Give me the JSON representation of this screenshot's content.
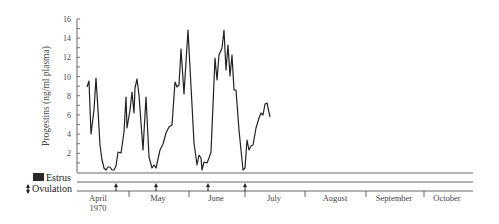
{
  "chart_data": {
    "type": "line",
    "title": "",
    "xlabel": "",
    "ylabel": "Progestins (ng/ml plasma)",
    "ylim": [
      0,
      16
    ],
    "yticks": [
      2,
      4,
      6,
      8,
      10,
      12,
      14,
      16
    ],
    "grid": false,
    "legend": [
      {
        "name": "Estrus",
        "symbol": "filled-rectangle"
      },
      {
        "name": "Ovulation",
        "symbol": "up-arrow"
      }
    ],
    "months": [
      {
        "label": "April",
        "sublabel": "1970"
      },
      {
        "label": "May",
        "sublabel": ""
      },
      {
        "label": "June",
        "sublabel": ""
      },
      {
        "label": "July",
        "sublabel": ""
      },
      {
        "label": "August",
        "sublabel": ""
      },
      {
        "label": "September",
        "sublabel": ""
      },
      {
        "label": "October",
        "sublabel": ""
      }
    ],
    "ovulation_markers_px": [
      116,
      156,
      208,
      245
    ],
    "series": [
      {
        "name": "Progestins",
        "points_px": [
          [
            87,
            87
          ],
          [
            89,
            81
          ],
          [
            91,
            134
          ],
          [
            94,
            110
          ],
          [
            96,
            78
          ],
          [
            98,
            110
          ],
          [
            100,
            145
          ],
          [
            102,
            160
          ],
          [
            104,
            168
          ],
          [
            106,
            170
          ],
          [
            108,
            167
          ],
          [
            110,
            167
          ],
          [
            112,
            170
          ],
          [
            114,
            170
          ],
          [
            116,
            166
          ],
          [
            118,
            152
          ],
          [
            121,
            153
          ],
          [
            124,
            132
          ],
          [
            126,
            97
          ],
          [
            127,
            128
          ],
          [
            130,
            110
          ],
          [
            132,
            92
          ],
          [
            134,
            113
          ],
          [
            135,
            88
          ],
          [
            137,
            79
          ],
          [
            139,
            95
          ],
          [
            143,
            150
          ],
          [
            146,
            97
          ],
          [
            149,
            157
          ],
          [
            152,
            168
          ],
          [
            154,
            165
          ],
          [
            156,
            168
          ],
          [
            160,
            150
          ],
          [
            163,
            144
          ],
          [
            166,
            133
          ],
          [
            169,
            127
          ],
          [
            172,
            125
          ],
          [
            175,
            82
          ],
          [
            177,
            87
          ],
          [
            179,
            85
          ],
          [
            181,
            49
          ],
          [
            184,
            94
          ],
          [
            188,
            30
          ],
          [
            192,
            105
          ],
          [
            194,
            143
          ],
          [
            197,
            165
          ],
          [
            199,
            155
          ],
          [
            201,
            158
          ],
          [
            202,
            170
          ],
          [
            204,
            162
          ],
          [
            207,
            163
          ],
          [
            209,
            158
          ],
          [
            211,
            152
          ],
          [
            215,
            58
          ],
          [
            217,
            80
          ],
          [
            219,
            55
          ],
          [
            222,
            48
          ],
          [
            224,
            30
          ],
          [
            226,
            70
          ],
          [
            228,
            45
          ],
          [
            230,
            76
          ],
          [
            232,
            55
          ],
          [
            234,
            90
          ],
          [
            236,
            90
          ],
          [
            239,
            130
          ],
          [
            243,
            170
          ],
          [
            245,
            168
          ],
          [
            247,
            140
          ],
          [
            249,
            150
          ],
          [
            251,
            146
          ],
          [
            253,
            145
          ],
          [
            256,
            128
          ],
          [
            259,
            118
          ],
          [
            261,
            113
          ],
          [
            263,
            115
          ],
          [
            265,
            104
          ],
          [
            267,
            103
          ],
          [
            270,
            117
          ]
        ],
        "approx_values_ng_ml": [
          8.8,
          9.5,
          4.0,
          6.5,
          10.0,
          6.5,
          2.8,
          1.2,
          0.4,
          0.2,
          0.5,
          0.5,
          0.2,
          0.2,
          0.6,
          2.1,
          2.0,
          4.2,
          7.8,
          4.6,
          6.5,
          8.3,
          6.1,
          8.7,
          9.7,
          8.0,
          2.3,
          7.8,
          1.6,
          0.4,
          0.8,
          0.4,
          2.3,
          2.9,
          4.1,
          4.7,
          5.0,
          9.4,
          8.8,
          9.0,
          12.8,
          8.1,
          14.8,
          7.0,
          3.0,
          0.8,
          1.8,
          1.5,
          0.2,
          1.0,
          0.9,
          1.5,
          2.1,
          11.9,
          9.5,
          12.2,
          12.9,
          14.8,
          10.6,
          13.2,
          10.0,
          12.2,
          8.5,
          8.5,
          4.4,
          0.2,
          0.5,
          3.4,
          2.3,
          2.7,
          2.9,
          4.6,
          5.6,
          6.1,
          5.9,
          7.1,
          7.2,
          5.8
        ]
      }
    ]
  },
  "legend": {
    "estrus_label": "Estrus",
    "ovulation_label": "Ovulation"
  },
  "colors": {
    "line": "#222222",
    "axis": "#555555",
    "text": "#444444",
    "estrus_box": "#2a2a2a"
  }
}
